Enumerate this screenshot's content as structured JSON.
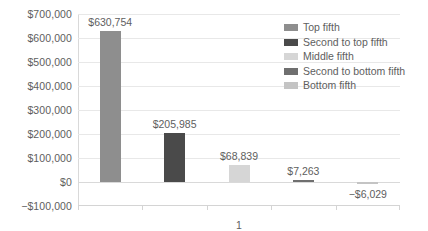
{
  "chart_data": {
    "type": "bar",
    "title": "",
    "xlabel": "",
    "ylabel": "",
    "categories": [
      "1"
    ],
    "ylim": [
      -100000,
      700000
    ],
    "ytick_step": 100000,
    "grid": true,
    "legend_position": "inside-top-right",
    "ytick_labels": [
      "$700,000",
      "$600,000",
      "$500,000",
      "$400,000",
      "$300,000",
      "$200,000",
      "$100,000",
      "$0",
      "−$100,000"
    ],
    "ytick_values": [
      700000,
      600000,
      500000,
      400000,
      300000,
      200000,
      100000,
      0,
      -100000
    ],
    "series": [
      {
        "name": "Top fifth",
        "value": 630754,
        "label": "$630,754",
        "color": "#8e8e8e"
      },
      {
        "name": "Second to top fifth",
        "value": 205985,
        "label": "$205,985",
        "color": "#4a4a4a"
      },
      {
        "name": "Middle fifth",
        "value": 68839,
        "label": "$68,839",
        "color": "#d6d6d6"
      },
      {
        "name": "Second to bottom fifth",
        "value": 7263,
        "label": "$7,263",
        "color": "#6f6f6f"
      },
      {
        "name": "Bottom fifth",
        "value": -6029,
        "label": "−$6,029",
        "color": "#c4c4c4"
      }
    ]
  },
  "legend": {
    "items": [
      {
        "label": "Top fifth",
        "color": "#8e8e8e"
      },
      {
        "label": "Second to top fifth",
        "color": "#4a4a4a"
      },
      {
        "label": "Middle fifth",
        "color": "#d6d6d6"
      },
      {
        "label": "Second to bottom fifth",
        "color": "#6f6f6f"
      },
      {
        "label": "Bottom fifth",
        "color": "#c4c4c4"
      }
    ]
  },
  "colors": {
    "grid": "#e8e8e8",
    "axis": "#d4d4d4",
    "text": "#5e5e5e",
    "background": "#ffffff"
  }
}
